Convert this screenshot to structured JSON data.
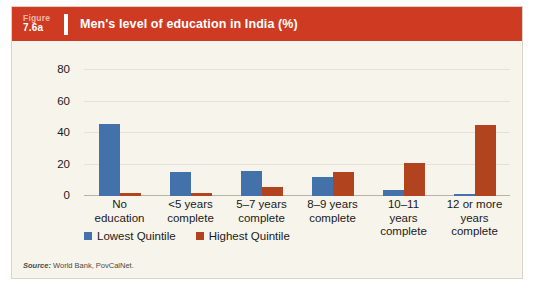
{
  "header": {
    "figure_word": "Figure",
    "figure_number": "7.6a",
    "title": "Men's level of education in India (%)"
  },
  "source": {
    "label": "Source:",
    "text": " World Bank, PovCalNet."
  },
  "chart_data": {
    "type": "bar",
    "title": "Men's level of education in India (%)",
    "xlabel": "",
    "ylabel": "",
    "ylim": [
      0,
      80
    ],
    "yticks": [
      0,
      20,
      40,
      60,
      80
    ],
    "grid": true,
    "legend_position": "bottom-left",
    "categories": [
      "No education",
      "<5 years complete",
      "5–7 years complete",
      "8–9 years complete",
      "10–11 years complete",
      "12 or more years complete"
    ],
    "category_lines": [
      [
        "No",
        "education"
      ],
      [
        "<5 years",
        "complete"
      ],
      [
        "5–7 years",
        "complete"
      ],
      [
        "8–9 years",
        "complete"
      ],
      [
        "10–11",
        "years",
        "complete"
      ],
      [
        "12 or more",
        "years",
        "complete"
      ]
    ],
    "series": [
      {
        "name": "Lowest Quintile",
        "color": "#4372aa",
        "values": [
          46,
          15,
          16,
          12,
          4,
          1
        ]
      },
      {
        "name": "Highest Quintile",
        "color": "#b1441e",
        "values": [
          2,
          2,
          6,
          15,
          21,
          45
        ]
      }
    ]
  },
  "colors": {
    "banner": "#cf3a22",
    "background": "#f7f4ec",
    "lowest_quintile": "#4372aa",
    "highest_quintile": "#b1441e"
  }
}
